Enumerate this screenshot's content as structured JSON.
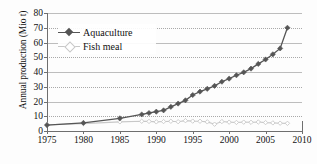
{
  "chart_data": {
    "type": "line",
    "title": "",
    "xlabel": "",
    "ylabel": "Annual production (Mio t)",
    "xlim": [
      1975,
      2010
    ],
    "ylim": [
      0,
      80
    ],
    "xticks": [
      1975,
      1980,
      1985,
      1990,
      1995,
      2000,
      2005,
      2010
    ],
    "yticks": [
      0,
      10,
      20,
      30,
      40,
      50,
      60,
      70,
      80
    ],
    "grid": "horizontal-dotted",
    "legend_position": "upper-left-inside",
    "series": [
      {
        "name": "Aquaculture",
        "color": "#555555",
        "marker": "diamond",
        "x": [
          1975,
          1980,
          1985,
          1988,
          1989,
          1990,
          1991,
          1992,
          1993,
          1994,
          1995,
          1996,
          1997,
          1998,
          1999,
          2000,
          2001,
          2002,
          2003,
          2004,
          2005,
          2006,
          2007,
          2008
        ],
        "values": [
          4.0,
          5.5,
          8.6,
          11.2,
          12.2,
          13.1,
          14.0,
          16.4,
          18.6,
          20.8,
          24.4,
          26.7,
          28.6,
          30.6,
          33.4,
          35.5,
          37.8,
          39.8,
          42.3,
          45.5,
          48.5,
          52.0,
          56.0,
          70.0
        ]
      },
      {
        "name": "Fish meal",
        "color": "#c8c8c8",
        "marker": "diamond-open",
        "x": [
          1975,
          1980,
          1985,
          1988,
          1989,
          1990,
          1991,
          1992,
          1993,
          1994,
          1995,
          1996,
          1997,
          1998,
          1999,
          2000,
          2001,
          2002,
          2003,
          2004,
          2005,
          2006,
          2007,
          2008
        ],
        "values": [
          4.2,
          5.0,
          6.2,
          6.6,
          6.5,
          6.2,
          6.4,
          6.6,
          6.3,
          7.0,
          6.7,
          6.6,
          6.2,
          4.6,
          6.4,
          6.0,
          5.8,
          6.0,
          5.9,
          6.1,
          5.7,
          5.5,
          5.3,
          5.2
        ]
      }
    ]
  }
}
